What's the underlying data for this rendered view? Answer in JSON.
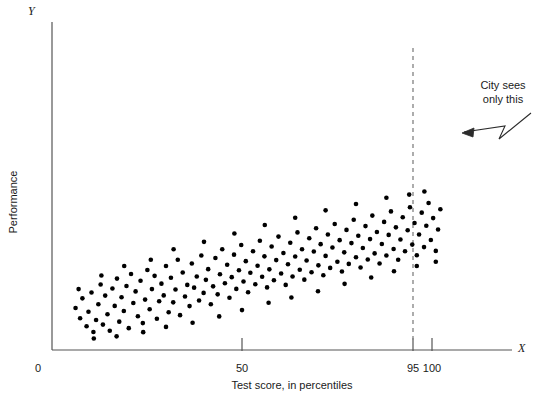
{
  "chart_data": {
    "type": "scatter",
    "title": "",
    "xlabel": "Test score, in percentiles",
    "ylabel": "Performance",
    "x_axis_symbol": "X",
    "y_axis_symbol": "Y",
    "origin_label": "0",
    "xlim": [
      0,
      112
    ],
    "ylim": [
      0,
      100
    ],
    "grid": false,
    "legend": null,
    "xticks": [
      {
        "value": 50,
        "label": "50"
      },
      {
        "value": 95,
        "label": "95"
      },
      {
        "value": 100,
        "label": "100"
      }
    ],
    "yticks": [],
    "annotations": [
      {
        "name": "city-sees-only-this",
        "lines": [
          "City sees",
          "only this"
        ],
        "arrow": "zigzag pointing down-left toward region right of x=95"
      }
    ],
    "reference_lines": [
      {
        "name": "cutoff-95",
        "axis": "x",
        "value": 95,
        "style": "dashed",
        "color": "#8a8a8a"
      }
    ],
    "marker": {
      "shape": "circle",
      "color": "#000000",
      "size_px": 4.6
    },
    "points": [
      [
        6.2,
        20.0
      ],
      [
        7.4,
        15.1
      ],
      [
        8.0,
        24.6
      ],
      [
        9.1,
        11.3
      ],
      [
        9.6,
        18.2
      ],
      [
        10.4,
        27.4
      ],
      [
        10.9,
        8.6
      ],
      [
        11.6,
        14.3
      ],
      [
        12.2,
        21.8
      ],
      [
        12.8,
        31.2
      ],
      [
        13.4,
        12.1
      ],
      [
        14.0,
        25.9
      ],
      [
        14.6,
        17.0
      ],
      [
        15.2,
        9.2
      ],
      [
        15.9,
        29.3
      ],
      [
        16.5,
        21.0
      ],
      [
        17.1,
        34.0
      ],
      [
        17.7,
        13.5
      ],
      [
        18.3,
        25.1
      ],
      [
        18.9,
        18.6
      ],
      [
        19.6,
        30.5
      ],
      [
        20.2,
        10.4
      ],
      [
        20.8,
        36.2
      ],
      [
        21.4,
        22.4
      ],
      [
        22.0,
        27.9
      ],
      [
        22.6,
        16.1
      ],
      [
        23.3,
        33.0
      ],
      [
        23.9,
        12.8
      ],
      [
        24.5,
        24.0
      ],
      [
        25.1,
        38.1
      ],
      [
        25.7,
        19.4
      ],
      [
        26.3,
        29.0
      ],
      [
        27.0,
        35.3
      ],
      [
        27.6,
        14.9
      ],
      [
        28.2,
        23.2
      ],
      [
        28.8,
        31.6
      ],
      [
        29.4,
        26.0
      ],
      [
        30.0,
        40.0
      ],
      [
        30.7,
        18.0
      ],
      [
        31.3,
        34.4
      ],
      [
        31.9,
        22.7
      ],
      [
        32.5,
        28.8
      ],
      [
        33.1,
        43.0
      ],
      [
        33.7,
        16.6
      ],
      [
        34.4,
        36.9
      ],
      [
        35.0,
        25.5
      ],
      [
        35.6,
        31.0
      ],
      [
        36.2,
        20.9
      ],
      [
        36.8,
        41.2
      ],
      [
        37.4,
        29.7
      ],
      [
        38.1,
        35.0
      ],
      [
        38.7,
        23.6
      ],
      [
        39.3,
        45.0
      ],
      [
        39.9,
        27.2
      ],
      [
        40.5,
        33.4
      ],
      [
        41.1,
        38.5
      ],
      [
        41.8,
        21.8
      ],
      [
        42.4,
        30.3
      ],
      [
        43.0,
        43.8
      ],
      [
        43.6,
        26.5
      ],
      [
        44.2,
        36.1
      ],
      [
        44.8,
        48.0
      ],
      [
        45.5,
        31.8
      ],
      [
        46.1,
        40.6
      ],
      [
        46.7,
        24.9
      ],
      [
        47.3,
        34.7
      ],
      [
        47.9,
        45.4
      ],
      [
        48.5,
        29.1
      ],
      [
        49.2,
        38.0
      ],
      [
        49.8,
        50.0
      ],
      [
        50.4,
        32.6
      ],
      [
        51.0,
        42.3
      ],
      [
        51.6,
        27.5
      ],
      [
        52.2,
        36.8
      ],
      [
        52.9,
        47.0
      ],
      [
        53.5,
        31.3
      ],
      [
        54.1,
        40.1
      ],
      [
        54.7,
        52.0
      ],
      [
        55.3,
        34.9
      ],
      [
        55.9,
        44.6
      ],
      [
        56.6,
        29.8
      ],
      [
        57.2,
        38.4
      ],
      [
        57.8,
        49.3
      ],
      [
        58.4,
        33.2
      ],
      [
        59.0,
        42.8
      ],
      [
        59.6,
        54.0
      ],
      [
        60.3,
        36.4
      ],
      [
        60.9,
        46.2
      ],
      [
        61.5,
        31.0
      ],
      [
        62.1,
        40.8
      ],
      [
        62.7,
        51.1
      ],
      [
        63.3,
        35.0
      ],
      [
        64.0,
        44.5
      ],
      [
        64.6,
        56.0
      ],
      [
        65.2,
        38.2
      ],
      [
        65.8,
        48.0
      ],
      [
        66.4,
        33.5
      ],
      [
        67.0,
        42.6
      ],
      [
        67.7,
        53.2
      ],
      [
        68.3,
        37.0
      ],
      [
        68.9,
        46.9
      ],
      [
        69.5,
        58.0
      ],
      [
        70.1,
        40.3
      ],
      [
        70.7,
        50.4
      ],
      [
        71.4,
        35.6
      ],
      [
        72.0,
        44.8
      ],
      [
        72.6,
        55.0
      ],
      [
        73.2,
        39.1
      ],
      [
        73.8,
        48.8
      ],
      [
        74.4,
        60.0
      ],
      [
        75.1,
        42.0
      ],
      [
        75.7,
        52.3
      ],
      [
        76.3,
        37.4
      ],
      [
        76.9,
        46.5
      ],
      [
        77.5,
        57.2
      ],
      [
        78.1,
        41.0
      ],
      [
        78.8,
        50.9
      ],
      [
        79.4,
        62.0
      ],
      [
        80.0,
        44.2
      ],
      [
        80.6,
        54.4
      ],
      [
        81.2,
        39.3
      ],
      [
        81.8,
        48.6
      ],
      [
        82.5,
        59.0
      ],
      [
        83.1,
        43.1
      ],
      [
        83.7,
        52.8
      ],
      [
        84.3,
        64.0
      ],
      [
        84.9,
        46.0
      ],
      [
        85.5,
        56.2
      ],
      [
        86.2,
        41.2
      ],
      [
        86.8,
        50.5
      ],
      [
        87.4,
        61.0
      ],
      [
        88.0,
        45.0
      ],
      [
        88.6,
        54.8
      ],
      [
        89.2,
        66.0
      ],
      [
        89.9,
        48.1
      ],
      [
        90.5,
        58.4
      ],
      [
        91.1,
        43.0
      ],
      [
        91.7,
        52.6
      ],
      [
        92.3,
        63.2
      ],
      [
        92.9,
        47.0
      ],
      [
        93.6,
        57.0
      ],
      [
        94.2,
        68.0
      ],
      [
        94.8,
        50.2
      ],
      [
        95.4,
        60.5
      ],
      [
        96.0,
        45.1
      ],
      [
        96.6,
        55.0
      ],
      [
        97.3,
        65.4
      ],
      [
        97.9,
        49.0
      ],
      [
        98.5,
        59.2
      ],
      [
        99.1,
        70.0
      ],
      [
        99.7,
        52.4
      ],
      [
        100.3,
        62.8
      ],
      [
        101.0,
        47.2
      ],
      [
        101.6,
        57.4
      ],
      [
        102.2,
        67.0
      ],
      [
        7.0,
        29.0
      ],
      [
        13.0,
        35.5
      ],
      [
        19.0,
        40.0
      ],
      [
        26.0,
        43.0
      ],
      [
        32.0,
        48.0
      ],
      [
        40.0,
        51.5
      ],
      [
        48.0,
        55.5
      ],
      [
        56.0,
        59.5
      ],
      [
        64.0,
        63.0
      ],
      [
        72.0,
        66.5
      ],
      [
        80.0,
        69.5
      ],
      [
        88.0,
        72.5
      ],
      [
        94.0,
        74.0
      ],
      [
        98.0,
        75.5
      ],
      [
        11.0,
        5.5
      ],
      [
        17.0,
        6.5
      ],
      [
        24.0,
        8.5
      ],
      [
        30.0,
        11.0
      ],
      [
        37.0,
        13.0
      ],
      [
        44.0,
        16.0
      ],
      [
        50.0,
        19.0
      ],
      [
        57.0,
        22.5
      ],
      [
        63.0,
        25.0
      ],
      [
        70.0,
        28.0
      ],
      [
        77.0,
        31.5
      ],
      [
        84.0,
        34.5
      ],
      [
        90.0,
        37.5
      ],
      [
        96.0,
        40.0
      ],
      [
        101.0,
        42.0
      ]
    ]
  }
}
